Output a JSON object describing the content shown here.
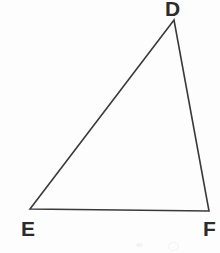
{
  "figure": {
    "kind": "geometry-diagram",
    "shape": "triangle",
    "name": "Triangle DEF",
    "background_color": "#fdfdfd",
    "stroke_color": "#3a3a3a",
    "stroke_width": 1.6,
    "label_color": "#2b2b2b",
    "vertices": [
      {
        "id": "D",
        "label": "D",
        "x": 174,
        "y": 20,
        "label_x": 173,
        "label_y": 9,
        "label_position": "above"
      },
      {
        "id": "E",
        "label": "E",
        "x": 30,
        "y": 209,
        "label_x": 27,
        "label_y": 229,
        "label_position": "below-left"
      },
      {
        "id": "F",
        "label": "F",
        "x": 209,
        "y": 211,
        "label_x": 209,
        "label_y": 229,
        "label_position": "below-right"
      }
    ],
    "edges": [
      {
        "id": "DE",
        "from": "D",
        "to": "E"
      },
      {
        "id": "EF",
        "from": "E",
        "to": "F"
      },
      {
        "id": "FD",
        "from": "F",
        "to": "D"
      }
    ],
    "polygon_points": "174,20 30,209 209,211"
  },
  "canvas": {
    "width": 220,
    "height": 253
  }
}
